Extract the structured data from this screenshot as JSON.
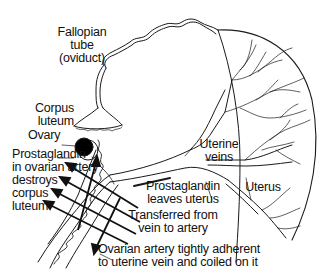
{
  "diagram": {
    "labels": {
      "fallopian_tube": "Fallopian\ntube\n(oviduct)",
      "corpus_luteum": "Corpus\nluteum",
      "ovary": "Ovary",
      "prostaglandin_artery": "Prostaglandin\nin ovarian artery\ndestroys\ncorpus\nluteum",
      "uterine_veins": "Uterine\nveins",
      "prostaglandin_leaves": "Prostaglandin\nleaves uterus",
      "transferred": "Transferred from\nvein to artery",
      "uterus": "Uterus",
      "ovarian_artery": "Ovarian artery tightly adherent\nto uterine vein and coiled on it"
    },
    "colors": {
      "line": "#1a1a1a",
      "ovary_fill": "#000000",
      "background": "#ffffff"
    }
  }
}
